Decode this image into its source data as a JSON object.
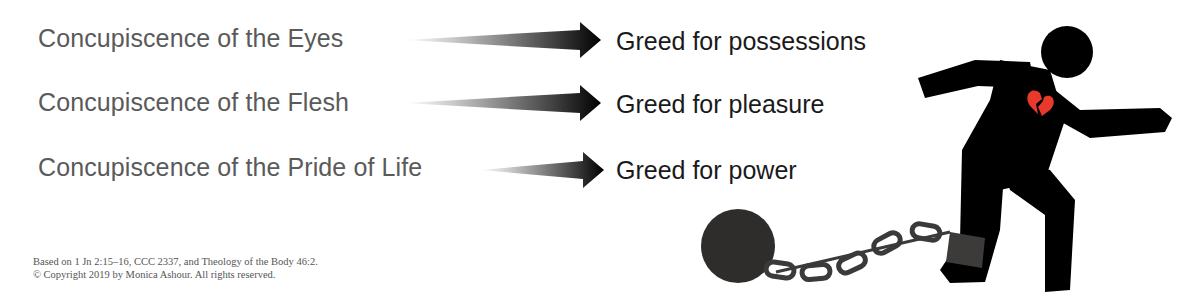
{
  "rows": [
    {
      "concupiscence": "Concupiscence of the Eyes",
      "greed": "Greed for possessions"
    },
    {
      "concupiscence": "Concupiscence of the Flesh",
      "greed": "Greed for pleasure"
    },
    {
      "concupiscence": "Concupiscence of the Pride of Life",
      "greed": "Greed for power"
    }
  ],
  "footnote": {
    "line1": "Based on 1 Jn 2:15–16, CCC 2337, and Theology of the Body 46:2.",
    "line2": "© Copyright 2019 by Monica Ashour. All rights reserved."
  },
  "illustration": {
    "subject": "running-figure-chained-to-ball",
    "heart_color": "#e8392c",
    "figure_color": "#000000",
    "chain_color": "#3a3a3a"
  }
}
